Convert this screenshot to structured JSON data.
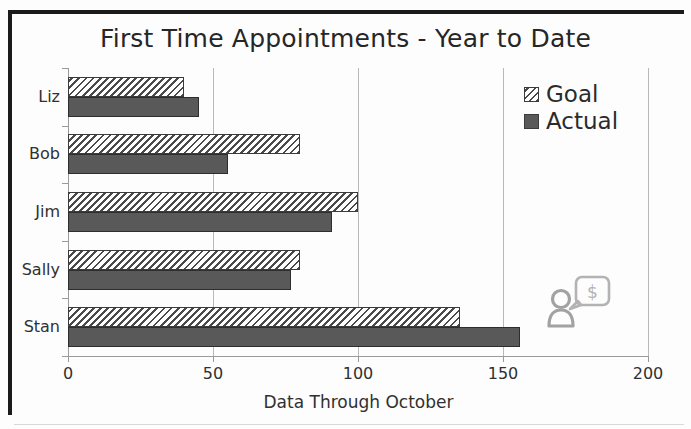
{
  "chart_data": {
    "type": "bar",
    "orientation": "horizontal",
    "title": "First Time Appointments - Year to Date",
    "xlabel": "Data Through October",
    "ylabel": "",
    "categories": [
      "Liz",
      "Bob",
      "Jim",
      "Sally",
      "Stan"
    ],
    "series": [
      {
        "name": "Goal",
        "values": [
          40,
          80,
          100,
          80,
          135
        ]
      },
      {
        "name": "Actual",
        "values": [
          45,
          55,
          91,
          77,
          156
        ]
      }
    ],
    "xlim": [
      0,
      200
    ],
    "xticks": [
      0,
      50,
      100,
      150,
      200
    ],
    "xtick_labels": [
      "0",
      "50",
      "100",
      "150",
      "200"
    ],
    "grid": true,
    "grid_axis": "x",
    "legend_position": "top-right",
    "colors": {
      "goal_fill": "#f2f2f2",
      "goal_hatch": "#4a4a4a",
      "actual_fill": "#595959",
      "bar_outline": "#3b3b3b",
      "gridline": "#b9b9b9",
      "axis": "#9a9a9a",
      "text": "#303030",
      "frame": "#1b1b1b"
    }
  },
  "legend": {
    "items": [
      {
        "label": "Goal",
        "swatch": "hatched-swatch"
      },
      {
        "label": "Actual",
        "swatch": "solid-swatch"
      }
    ]
  },
  "decoration": {
    "icon_name": "person-with-money-speech-bubble-icon",
    "currency_glyph": "$"
  }
}
